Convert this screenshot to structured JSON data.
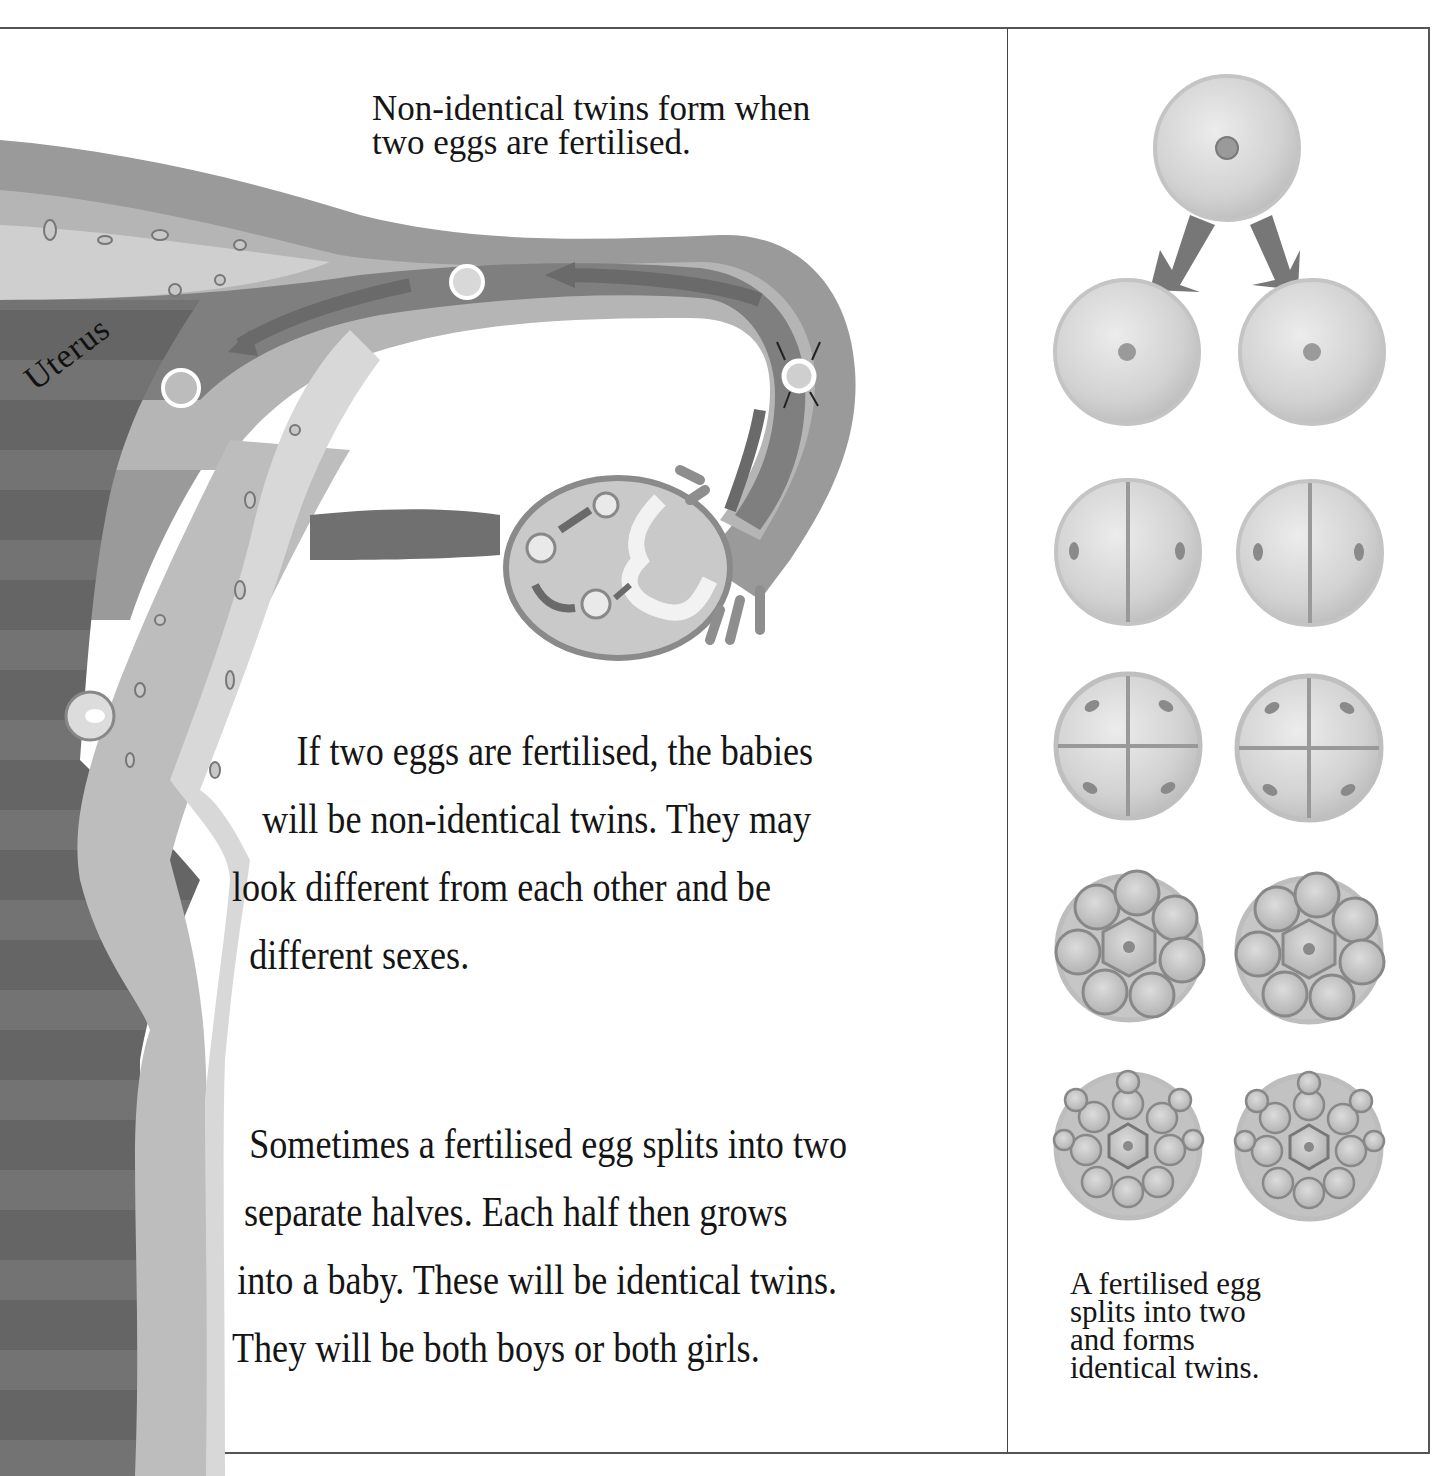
{
  "page": {
    "top_caption": {
      "lines": [
        "Non-identical twins form when",
        "two eggs are fertilised."
      ]
    },
    "diagram_label": "Uterus",
    "paragraph_1": {
      "lines": [
        "If two eggs are fertilised, the babies",
        "will be non-identical twins. They may",
        "look different from each other and be",
        "different sexes."
      ]
    },
    "paragraph_2": {
      "lines": [
        "Sometimes a fertilised egg splits into two",
        "separate halves. Each half then grows",
        "into a baby. These will be identical twins.",
        "They will be both boys or both girls."
      ]
    },
    "side_panel": {
      "caption_lines": [
        "A fertilised egg",
        "splits into two",
        "and forms",
        "identical twins."
      ],
      "stages": [
        {
          "name": "single-fertilised-egg",
          "cells": 1
        },
        {
          "name": "split-into-two",
          "cells": 1
        },
        {
          "name": "two-cell-stage",
          "cells": 2
        },
        {
          "name": "four-cell-stage",
          "cells": 4
        },
        {
          "name": "eight-cell-stage",
          "cells": 8
        },
        {
          "name": "morula-stage",
          "cells": 16
        }
      ]
    },
    "colors": {
      "tissue_dark": "#6f6f6f",
      "tissue_mid": "#8e8e8e",
      "tissue_light": "#b8b8b8",
      "tissue_pale": "#d4d4d4",
      "cell_fill": "#d9d9d9",
      "arrow": "#7a7a7a",
      "border": "#555555"
    }
  }
}
